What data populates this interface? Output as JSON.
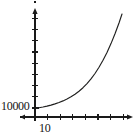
{
  "chart_data": {
    "type": "line",
    "title": "",
    "subtitle": "",
    "xlabel": "",
    "ylabel": "",
    "grid": false,
    "legend": null,
    "axes": {
      "x": {
        "origin_px": 35,
        "end_px": 133,
        "baseline_px": 117,
        "arrow": "right",
        "left_stub_px": 20,
        "tick_count": 8,
        "tick_spacing_px": 12.6,
        "tick_labels": [
          "10"
        ],
        "labeled_tick_index": 1,
        "tick_positions_px": [
          35,
          47.6,
          60.2,
          72.8,
          85.4,
          98,
          110.6,
          123.2
        ]
      },
      "y": {
        "origin_px": 117,
        "top_px": 10,
        "axis_x_px": 35,
        "arrow": "up",
        "tick_count": 9,
        "tick_spacing_px": 11.2,
        "tick_labels": [
          "10000"
        ],
        "labeled_tick_index": 0,
        "tick_positions_px": [
          108,
          96.8,
          85.6,
          74.4,
          63.2,
          52,
          40.8,
          29.6,
          18.4
        ]
      }
    },
    "x": [
      0,
      1,
      2,
      3,
      4,
      5,
      6,
      7,
      8,
      9,
      10,
      11,
      12,
      13,
      14,
      15,
      16
    ],
    "y": [
      10000,
      10600,
      11400,
      12400,
      13700,
      15400,
      17600,
      20500,
      24300,
      29300,
      36000,
      45000,
      57000,
      73000,
      94000,
      122000,
      158000
    ],
    "curve_points_px": [
      [
        35,
        108.5
      ],
      [
        39,
        107.8
      ],
      [
        43,
        107.0
      ],
      [
        47,
        106.1
      ],
      [
        51,
        105.1
      ],
      [
        55,
        103.9
      ],
      [
        59,
        102.5
      ],
      [
        63,
        100.9
      ],
      [
        67,
        99.0
      ],
      [
        71,
        96.8
      ],
      [
        75,
        94.2
      ],
      [
        79,
        91.2
      ],
      [
        83,
        87.7
      ],
      [
        87,
        83.6
      ],
      [
        91,
        78.9
      ],
      [
        95,
        73.5
      ],
      [
        99,
        67.3
      ],
      [
        103,
        60.3
      ],
      [
        107,
        52.4
      ],
      [
        111,
        43.6
      ],
      [
        115,
        33.8
      ],
      [
        119,
        23.0
      ],
      [
        122,
        14.0
      ]
    ],
    "colors": {
      "axis": "#1a1a1a",
      "curve": "#20201f",
      "text": "#141414",
      "background": "#ffffff"
    },
    "labels": {
      "y_tick_10000": "10000",
      "x_tick_10": "10"
    }
  }
}
